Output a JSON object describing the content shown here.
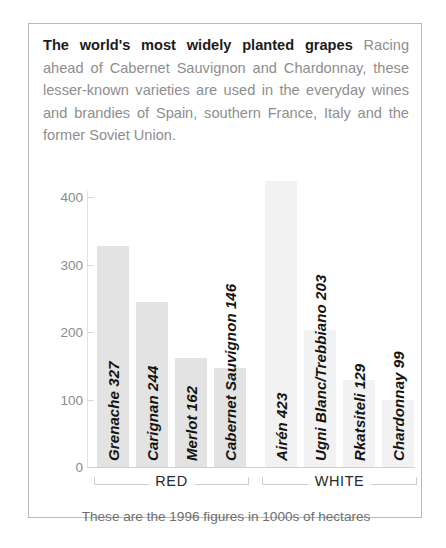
{
  "caption": {
    "lead": "The world's most widely planted grapes",
    "body": " Racing ahead of Cabernet Sauvignon and Chardonnay, these lesser-known varieties are used in the everyday wines and brandies of Spain, southern France, Italy and the former Soviet Union."
  },
  "footnote": "These are the 1996 figures in 1000s of hectares",
  "groups": [
    {
      "label": "RED"
    },
    {
      "label": "WHITE"
    }
  ],
  "colors": {
    "bar_red_group": "#e3e3e3",
    "bar_white_group": "#f2f2f2",
    "frame_border": "#b9b9b9",
    "axis": "#e2e2e2",
    "label_text": "#141414",
    "caption_lead": "#1b1b1b",
    "caption_body": "#8e8e8e"
  },
  "chart_data": {
    "type": "bar",
    "title": "The world's most widely planted grapes",
    "xlabel": "",
    "ylabel": "",
    "ylim": [
      0,
      440
    ],
    "yticks": [
      0,
      100,
      200,
      300,
      400
    ],
    "ytick_labels": [
      "0",
      "100",
      "200",
      "300",
      "400"
    ],
    "grid": false,
    "legend": "none",
    "units": "1000s of hectares",
    "year": 1996,
    "categories": [
      "Grenache",
      "Carignan",
      "Merlot",
      "Cabernet Sauvignon",
      "Airén",
      "Ugni Blanc/Trebbiano",
      "Rkatsiteli",
      "Chardonnay"
    ],
    "values": [
      327,
      244,
      162,
      146,
      423,
      203,
      129,
      99
    ],
    "bar_labels": [
      "Grenache 327",
      "Carignan 244",
      "Merlot 162",
      "Cabernet Sauvignon 146",
      "Airén 423",
      "Ugni Blanc/Trebbiano 203",
      "Rkatsiteli 129",
      "Chardonnay 99"
    ],
    "groups": [
      "RED",
      "RED",
      "RED",
      "RED",
      "WHITE",
      "WHITE",
      "WHITE",
      "WHITE"
    ]
  }
}
